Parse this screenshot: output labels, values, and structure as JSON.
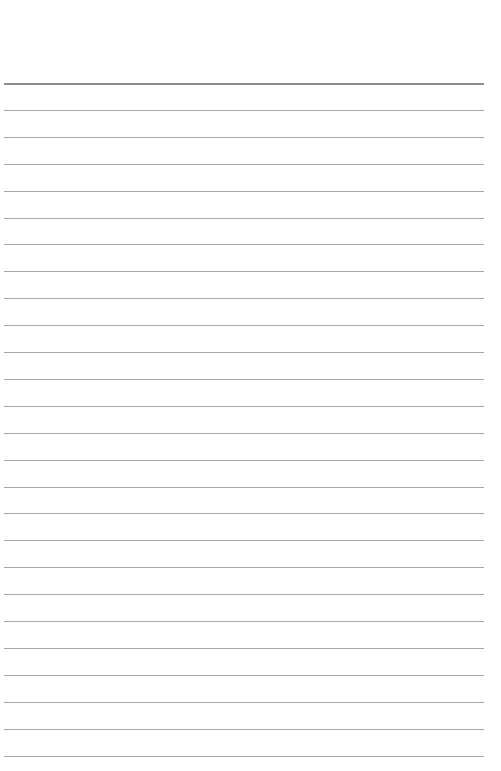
{
  "page": {
    "type": "lined-paper",
    "line_count": 26,
    "first_line_y": 83,
    "line_spacing": 26.9,
    "line_color": "#a9a9a9",
    "top_line_color": "#8c8c8c",
    "background": "#ffffff"
  }
}
